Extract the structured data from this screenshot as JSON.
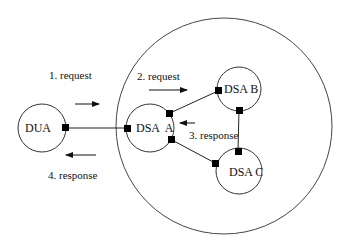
{
  "diagram": {
    "domain_circle": {
      "label": ""
    },
    "nodes": [
      {
        "id": "dua",
        "label": "DUA"
      },
      {
        "id": "dsa_a",
        "label": "DSA  A"
      },
      {
        "id": "dsa_b",
        "label": "DSA B"
      },
      {
        "id": "dsa_c",
        "label": "DSA C"
      }
    ],
    "edges": [
      {
        "from": "dua",
        "to": "dsa_a"
      },
      {
        "from": "dsa_a",
        "to": "dsa_b"
      },
      {
        "from": "dsa_a",
        "to": "dsa_c"
      },
      {
        "from": "dsa_b",
        "to": "dsa_c"
      }
    ],
    "messages": [
      {
        "step": 1,
        "label": "1. request",
        "direction": "right"
      },
      {
        "step": 2,
        "label": "2. request",
        "direction": "right"
      },
      {
        "step": 3,
        "label": "3. response",
        "direction": "left"
      },
      {
        "step": 4,
        "label": "4. response",
        "direction": "left"
      }
    ],
    "colors": {
      "stroke": "#222222",
      "background": "#ffffff"
    }
  }
}
